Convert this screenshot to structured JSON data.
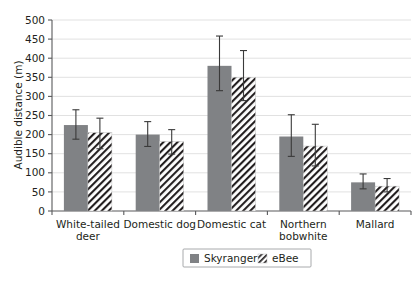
{
  "chart_data": {
    "type": "bar",
    "title": "",
    "subtitle": "",
    "xlabel": "",
    "ylabel": "Audible distance (m)",
    "ylim": [
      0,
      500
    ],
    "ytick_step": 50,
    "yticks": [
      0,
      50,
      100,
      150,
      200,
      250,
      300,
      350,
      400,
      450,
      500
    ],
    "ytick_labels": [
      "0",
      "50",
      "100",
      "150",
      "200",
      "250",
      "300",
      "350",
      "400",
      "450",
      "500"
    ],
    "grid": "horizontal",
    "legend_position": "bottom-center",
    "orientation": "vertical",
    "categories": [
      "White-tailed deer",
      "Domestic dog",
      "Domestic cat",
      "Northern bobwhite",
      "Mallard"
    ],
    "category_lines": [
      [
        "White-tailed",
        "deer"
      ],
      [
        "Domestic dog"
      ],
      [
        "Domestic cat"
      ],
      [
        "Northern",
        "bobwhite"
      ],
      [
        "Mallard"
      ]
    ],
    "series": [
      {
        "name": "Skyranger",
        "style": "solid-gray",
        "color": "#808285",
        "values": [
          225,
          200,
          380,
          195,
          75
        ],
        "err_low": [
          188,
          169,
          315,
          143,
          58
        ],
        "err_high": [
          265,
          234,
          458,
          252,
          97
        ]
      },
      {
        "name": "eBee",
        "style": "diagonal-hatch",
        "color": "#ffffff",
        "values": [
          205,
          182,
          350,
          170,
          65
        ],
        "err_low": [
          163,
          149,
          289,
          118,
          50
        ],
        "err_high": [
          243,
          213,
          420,
          227,
          85
        ]
      }
    ]
  },
  "legend": {
    "entries": [
      {
        "label": "Skyranger",
        "swatch": "solid-gray-swatch"
      },
      {
        "label": "eBee",
        "swatch": "hatch-swatch"
      }
    ]
  },
  "colors": {
    "series_solid": "#808285",
    "series_hatch_stroke": "#231f20",
    "gridline": "#d9d9d9",
    "axis": "#58595b",
    "error_bar": "#3a3a3a",
    "text": "#231f20",
    "background": "#ffffff"
  }
}
